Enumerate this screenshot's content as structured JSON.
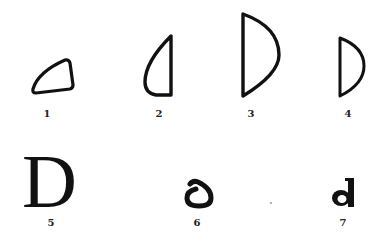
{
  "figure": {
    "stroke_color": "#111111",
    "background": "#ffffff",
    "items": [
      {
        "number": "1",
        "form": "rounded triangular delta",
        "label_x": 47,
        "label_y": 109
      },
      {
        "number": "2",
        "form": "tall narrow half-round, curve on left",
        "label_x": 159,
        "label_y": 109
      },
      {
        "number": "3",
        "form": "tall D shape, straight left, curve right",
        "label_x": 251,
        "label_y": 109
      },
      {
        "number": "4",
        "form": "smaller D shape",
        "label_x": 348,
        "label_y": 109
      },
      {
        "number": "5",
        "form": "serif capital D",
        "glyph": "D",
        "label_x": 51,
        "label_y": 218
      },
      {
        "number": "6",
        "form": "uncial / rounded delta-like d",
        "label_x": 197,
        "label_y": 218
      },
      {
        "number": "7",
        "form": "minuscule d",
        "label_x": 343,
        "label_y": 218
      }
    ]
  }
}
